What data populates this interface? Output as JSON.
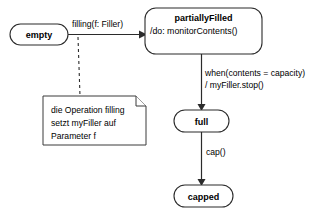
{
  "diagram": {
    "type": "uml-state-machine",
    "background_color": "#ffffff",
    "line_color": "#2b2b2b",
    "states": [
      {
        "id": "empty",
        "name": "empty",
        "activity": "",
        "x": 10,
        "y": 24,
        "w": 58,
        "h": 21
      },
      {
        "id": "partiallyFilled",
        "name": "partiallyFilled",
        "activity": "/do: monitorContents()",
        "x": 145,
        "y": 8,
        "w": 117,
        "h": 46
      },
      {
        "id": "full",
        "name": "full",
        "activity": "",
        "x": 174,
        "y": 110,
        "w": 55,
        "h": 22
      },
      {
        "id": "capped",
        "name": "capped",
        "activity": "",
        "x": 174,
        "y": 185,
        "w": 59,
        "h": 22
      }
    ],
    "transitions": [
      {
        "id": "empty-to-partiallyfilled",
        "from": "empty",
        "to": "partiallyFilled",
        "label": "filling(f: Filler)",
        "label_lines": [
          "filling(f: Filler)"
        ]
      },
      {
        "id": "partiallyfilled-to-full",
        "from": "partiallyFilled",
        "to": "full",
        "label": "when(contents = capacity) / myFiller.stop()",
        "label_lines": [
          "when(contents = capacity)",
          "/ myFiller.stop()"
        ]
      },
      {
        "id": "full-to-capped",
        "from": "full",
        "to": "capped",
        "label": "cap()",
        "label_lines": [
          "cap()"
        ]
      }
    ],
    "note": {
      "id": "note-filling-operation",
      "lines": [
        "die Operation filling",
        "setzt myFiller auf",
        "Parameter f"
      ],
      "x": 43,
      "y": 96,
      "w": 103,
      "h": 49,
      "fold_size": 10,
      "anchor_style": "dashed"
    }
  }
}
